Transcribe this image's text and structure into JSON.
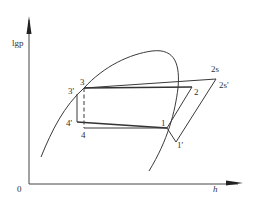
{
  "diagram": {
    "type": "lgp-h refrigeration cycle diagram",
    "axes": {
      "y_label": "lgp",
      "x_label": "h",
      "origin_label": "0"
    },
    "points": [
      {
        "id": "1",
        "label": "1"
      },
      {
        "id": "1p",
        "label": "1'"
      },
      {
        "id": "2",
        "label": "2"
      },
      {
        "id": "2s",
        "label": "2s"
      },
      {
        "id": "2sp",
        "label": "2s'"
      },
      {
        "id": "3",
        "label": "3"
      },
      {
        "id": "3p",
        "label": "3'"
      },
      {
        "id": "4",
        "label": "4"
      },
      {
        "id": "4p",
        "label": "4'"
      }
    ],
    "colors": {
      "line": "#3a3a3a",
      "text": "#333333",
      "background": "#ffffff"
    }
  }
}
